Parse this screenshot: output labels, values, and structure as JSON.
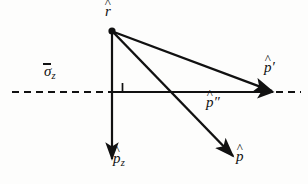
{
  "figure": {
    "kind": "vector-geometry-diagram",
    "background_color": "#fdfdfc",
    "stroke_color": "#111111",
    "labels": {
      "apex": {
        "base": "r",
        "accent": "^",
        "text": "r̂"
      },
      "axis": {
        "base": "σ",
        "accent": "¯",
        "subscript": "z",
        "text": "σ̄z"
      },
      "reflected": {
        "base": "p",
        "accent": "^",
        "prime": "′",
        "text": "p̂′"
      },
      "projection": {
        "base": "p",
        "accent": "^",
        "prime": "″",
        "text": "p̂″"
      },
      "incident": {
        "base": "p",
        "accent": "^",
        "text": "p̂"
      },
      "z_component": {
        "base": "p",
        "accent": "^",
        "subscript": "z",
        "text": "p̂z"
      }
    },
    "geometry": {
      "apex_point": {
        "x": 112,
        "y": 31,
        "dot_radius": 3.4
      },
      "axis_line_dashed": {
        "x1": 12,
        "y1": 92,
        "x2": 301,
        "y2": 92,
        "dash": "7 5"
      },
      "vector_pz": {
        "x1": 112,
        "y1": 31,
        "x2": 112,
        "y2": 160
      },
      "vector_p": {
        "x1": 112,
        "y1": 31,
        "x2": 234,
        "y2": 157
      },
      "vector_p_prime": {
        "x1": 112,
        "y1": 31,
        "x2": 272,
        "y2": 92
      },
      "vector_p_double_prime": {
        "x1": 112,
        "y1": 92,
        "x2": 272,
        "y2": 92
      },
      "right_angle_marker": {
        "x": 113,
        "y": 83,
        "size": 9
      }
    }
  }
}
